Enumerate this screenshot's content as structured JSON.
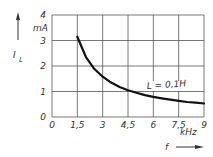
{
  "chart_data": {
    "type": "line",
    "title": "",
    "xlabel": "f",
    "xunit": "kHz",
    "ylabel": "I_L",
    "yunit": "mA",
    "xlim": [
      0,
      9
    ],
    "ylim": [
      0,
      4
    ],
    "grid": true,
    "x_ticks": [
      "0",
      "1,5",
      "3",
      "4,5",
      "6",
      "7,5",
      "9"
    ],
    "y_ticks": [
      "0",
      "1",
      "2",
      "3",
      "4"
    ],
    "annotation": "L = 0,1H",
    "series": [
      {
        "name": "L = 0,1H",
        "x": [
          1.5,
          2,
          2.5,
          3,
          3.5,
          4,
          4.5,
          5,
          5.5,
          6,
          6.5,
          7,
          7.5,
          8,
          8.5,
          9
        ],
        "y": [
          3.15,
          2.36,
          1.89,
          1.58,
          1.35,
          1.18,
          1.05,
          0.95,
          0.86,
          0.79,
          0.73,
          0.68,
          0.63,
          0.59,
          0.56,
          0.53
        ]
      }
    ]
  },
  "labels": {
    "y_symbol": "I",
    "y_subscript": "L",
    "y_unit": "mA",
    "x_symbol": "f",
    "x_unit": "kHz",
    "curve_label": "L = 0,1H"
  }
}
